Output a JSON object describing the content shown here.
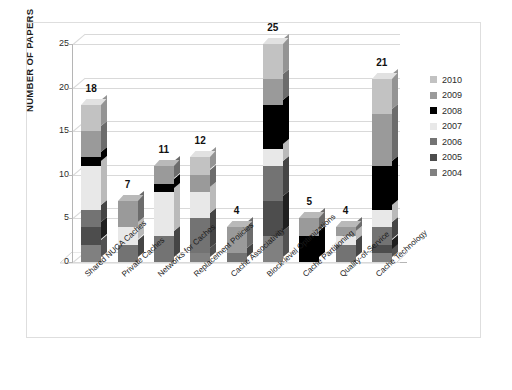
{
  "chart_data": {
    "type": "bar",
    "subtype": "stacked-column-3d",
    "title": "",
    "xlabel": "",
    "ylabel": "NUMBER OF PAPERS",
    "ylim": [
      0,
      25
    ],
    "yticks": [
      0,
      5,
      10,
      15,
      20,
      25
    ],
    "grid": true,
    "legend_position": "right",
    "legend_order_top_to_bottom": [
      "2010",
      "2009",
      "2008",
      "2007",
      "2006",
      "2005",
      "2004"
    ],
    "categories": [
      "Shared NUCA Caches",
      "Private Caches",
      "Networks for Caches",
      "Replacement Policies",
      "Cache Associativity",
      "Block-level Optimizations",
      "Cache Partitioning",
      "Quality-of-Service",
      "Cache Technology"
    ],
    "series": [
      {
        "name": "2004",
        "color": "#808080",
        "values": [
          2,
          0,
          0,
          1,
          0,
          3,
          0,
          0,
          1
        ]
      },
      {
        "name": "2005",
        "color": "#4d4d4d",
        "values": [
          2,
          0,
          0,
          0,
          0,
          4,
          0,
          0,
          1
        ]
      },
      {
        "name": "2006",
        "color": "#737373",
        "values": [
          2,
          2,
          3,
          4,
          1,
          4,
          0,
          2,
          2
        ]
      },
      {
        "name": "2007",
        "color": "#e8e8e8",
        "values": [
          5,
          2,
          5,
          3,
          0,
          2,
          0,
          1,
          2
        ]
      },
      {
        "name": "2008",
        "color": "#000000",
        "values": [
          1,
          0,
          1,
          0,
          0,
          5,
          3,
          0,
          5
        ]
      },
      {
        "name": "2009",
        "color": "#9a9a9a",
        "values": [
          3,
          3,
          2,
          2,
          3,
          3,
          2,
          1,
          6
        ]
      },
      {
        "name": "2010",
        "color": "#c2c2c2",
        "values": [
          3,
          0,
          0,
          2,
          0,
          4,
          0,
          0,
          4
        ]
      }
    ],
    "totals": [
      18,
      7,
      11,
      12,
      4,
      25,
      5,
      4,
      21
    ],
    "total_labels": [
      "18",
      "7",
      "11",
      "12",
      "4",
      "25",
      "5",
      "4",
      "21"
    ]
  },
  "legend": {
    "items": [
      {
        "label": "2010",
        "color": "#c2c2c2"
      },
      {
        "label": "2009",
        "color": "#9a9a9a"
      },
      {
        "label": "2008",
        "color": "#000000"
      },
      {
        "label": "2007",
        "color": "#e8e8e8"
      },
      {
        "label": "2006",
        "color": "#737373"
      },
      {
        "label": "2005",
        "color": "#4d4d4d"
      },
      {
        "label": "2004",
        "color": "#808080"
      }
    ]
  },
  "axis": {
    "y_title": "NUMBER OF PAPERS",
    "y_tick_labels": [
      "25",
      "20",
      "15",
      "10",
      "5",
      "0"
    ]
  },
  "colors": {
    "gridline": "#d9d9d9",
    "axis": "#b5b5b5",
    "frame": "#dedede",
    "background": "#ffffff",
    "text": "#1a1a1a"
  }
}
